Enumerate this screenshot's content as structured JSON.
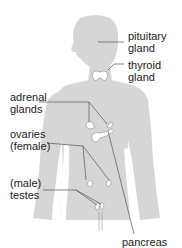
{
  "diagram": {
    "title": "",
    "colors": {
      "body": "#d6d6d6",
      "glands": "#ffffff",
      "leader_lines": "#555555",
      "text": "#222222"
    },
    "labels": {
      "pituitary": {
        "line1": "pituitary",
        "line2": "gland"
      },
      "thyroid": {
        "line1": "thyroid",
        "line2": "gland"
      },
      "adrenal": {
        "line1": "adrenal",
        "line2": "glands"
      },
      "ovaries": {
        "line1": "ovaries",
        "line2": "(female)"
      },
      "testes": {
        "line1": "(male)",
        "line2": "testes"
      },
      "pancreas": {
        "line1": "pancreas"
      }
    }
  }
}
